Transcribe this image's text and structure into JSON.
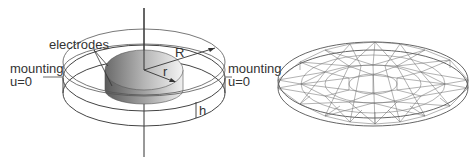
{
  "left_panel": {
    "labels": {
      "electrodes": "electrodes",
      "mounting_left": "mounting",
      "u_left": "u=0",
      "mounting_right": "mounting",
      "u_right": "u=0",
      "outer_radius": "R",
      "inner_radius": "r",
      "height": "h"
    }
  },
  "right_panel": {
    "description": "finite element mesh of disc"
  },
  "colors": {
    "line": "#444444",
    "electrode_dark": "#555555",
    "electrode_light": "#e6e6e6",
    "mesh": "#666666"
  }
}
